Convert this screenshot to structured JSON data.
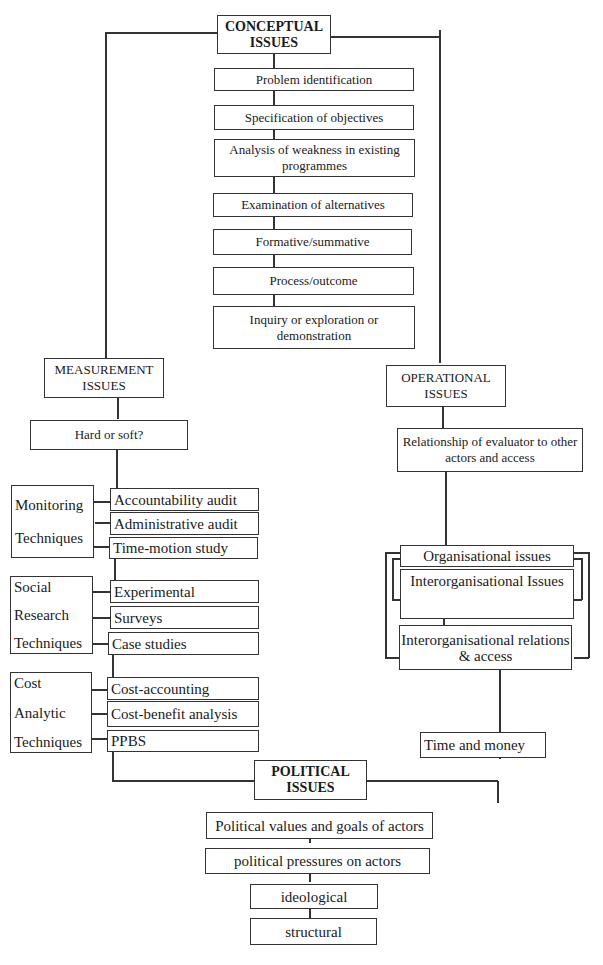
{
  "conceptual": {
    "header": [
      "CONCEPTUAL",
      "ISSUES"
    ],
    "items": [
      "Problem identification",
      "Specification of objectives",
      "Analysis of weakness in existing programmes",
      "Examination of alternatives",
      "Formative/summative",
      "Process/outcome",
      "Inquiry or exploration or demonstration"
    ]
  },
  "measurement": {
    "header": [
      "MEASUREMENT",
      "ISSUES"
    ],
    "question": "Hard or soft?",
    "groups": [
      {
        "label": [
          "Monitoring",
          "Techniques"
        ],
        "items": [
          "Accountability audit",
          "Administrative audit",
          "Time-motion study"
        ]
      },
      {
        "label": [
          "Social",
          "Research",
          "Techniques"
        ],
        "items": [
          "Experimental",
          "Surveys",
          "Case studies"
        ]
      },
      {
        "label": [
          "Cost",
          "Analytic",
          "Techniques"
        ],
        "items": [
          "Cost-accounting",
          "Cost-benefit analysis",
          "PPBS"
        ]
      }
    ]
  },
  "operational": {
    "header": [
      "OPERATIONAL",
      "ISSUES"
    ],
    "relationship": "Relationship of evaluator to other actors and access",
    "organisational": "Organisational issues",
    "interorganisational": "Interorganisational Issues",
    "interorg_relations": "Interorganisational relations & access",
    "time_money": "Time and money"
  },
  "political": {
    "header": [
      "POLITICAL",
      "ISSUES"
    ],
    "items": [
      "Political values and goals of actors",
      "political pressures on actors",
      "ideological",
      "structural"
    ]
  }
}
